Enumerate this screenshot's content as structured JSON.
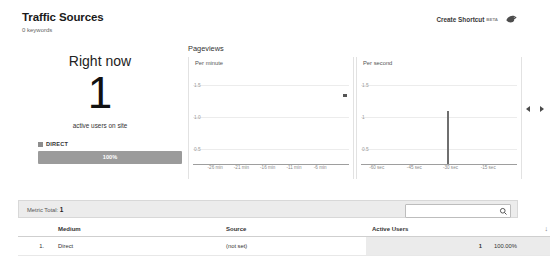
{
  "header": {
    "title": "Traffic Sources",
    "subtitle": "0 keywords",
    "create_shortcut_label": "Create Shortcut",
    "beta_label": "BETA",
    "shortcut_icon": "bird-icon"
  },
  "right_now": {
    "title": "Right now",
    "count": "1",
    "caption": "active users on site",
    "legend_label": "DIRECT",
    "legend_color": "#8d8d8d",
    "share_label": "100%",
    "share_percent": 100,
    "bar_color": "#9b9b9b"
  },
  "pageviews": {
    "title": "Pageviews",
    "per_minute": {
      "caption": "Per minute",
      "y_ticks": [
        "1.5",
        "1.0",
        "0.5"
      ],
      "x_ticks": [
        "-26 min",
        "-21 min",
        "-16 min",
        "-11 min",
        "-6 min"
      ]
    },
    "per_second": {
      "caption": "Per second",
      "y_ticks": [
        "1.5",
        "1",
        "0.5"
      ],
      "x_ticks": [
        "-60 sec",
        "-45 sec",
        "-30 sec",
        "-15 sec"
      ]
    }
  },
  "chart_data": [
    {
      "type": "bar",
      "title": "Per minute",
      "xlabel": "",
      "ylabel": "",
      "ylim": [
        0,
        1.75
      ],
      "grid": true,
      "categories": [
        "-26 min",
        "-21 min",
        "-16 min",
        "-11 min",
        "-6 min"
      ],
      "values": [
        0,
        0,
        0,
        0,
        0
      ],
      "bars": []
    },
    {
      "type": "bar",
      "title": "Per second",
      "xlabel": "",
      "ylabel": "",
      "ylim": [
        0,
        1.75
      ],
      "grid": true,
      "categories": [
        "-60 sec",
        "-45 sec",
        "-30 sec",
        "-15 sec"
      ],
      "values": [
        0,
        0,
        1,
        0
      ],
      "bars": [
        {
          "x_percent": 55,
          "value": 1
        }
      ]
    }
  ],
  "metric_total": {
    "label": "Metric Total:",
    "value": "1"
  },
  "search": {
    "value": "",
    "placeholder": "",
    "icon": "search-icon"
  },
  "table": {
    "columns": [
      "Medium",
      "Source",
      "Active Users"
    ],
    "sort_indicator": "↓",
    "rows": [
      {
        "rank": "1.",
        "medium": "Direct",
        "source": "(not set)",
        "active_users": "1",
        "percent": "100.00%"
      }
    ]
  }
}
